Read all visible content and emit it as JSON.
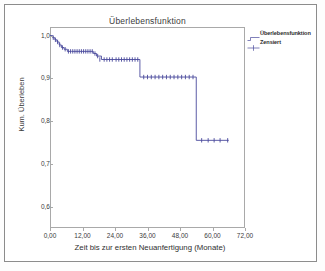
{
  "chart_data": {
    "type": "line",
    "title": "Überlebensfunktion",
    "xlabel": "Zeit bis zur ersten Neuanfertigung (Monate)",
    "ylabel": "Kum. Überleben",
    "xlim": [
      0,
      72
    ],
    "ylim": [
      0.55,
      1.02
    ],
    "grid": false,
    "legend_position": "right",
    "legend": [
      {
        "label": "Überlebensfunktion",
        "marker": "step-line",
        "color": "#4a4a9c"
      },
      {
        "label": "Zensiert",
        "marker": "plus-tick",
        "color": "#4a4a9c"
      }
    ],
    "xticks": [
      "0,00",
      "12,00",
      "24,00",
      "36,00",
      "48,00",
      "60,00",
      "72,00"
    ],
    "xtick_values": [
      0,
      12,
      24,
      36,
      48,
      60,
      72
    ],
    "yticks": [
      "1,0",
      "0,9",
      "0,8",
      "0,7",
      "0,6"
    ],
    "ytick_values": [
      1.0,
      0.9,
      0.8,
      0.7,
      0.6
    ],
    "series": [
      {
        "name": "Überlebensfunktion",
        "type": "kaplan-meier-step",
        "x": [
          0.0,
          1.0,
          1.8,
          2.6,
          3.4,
          4.2,
          5.2,
          6.4,
          8.0,
          16.0,
          17.2,
          19.0,
          24.0,
          33.2,
          54.0,
          66.0
        ],
        "y": [
          1.0,
          0.995,
          0.99,
          0.985,
          0.978,
          0.972,
          0.968,
          0.963,
          0.963,
          0.958,
          0.952,
          0.944,
          0.944,
          0.903,
          0.755,
          0.755
        ]
      }
    ],
    "censored_points": {
      "name": "Zensiert",
      "x": [
        1.2,
        2.0,
        2.8,
        3.6,
        4.6,
        5.6,
        6.8,
        7.6,
        8.4,
        9.2,
        10.0,
        10.8,
        11.6,
        12.4,
        13.2,
        14.0,
        14.8,
        15.6,
        16.6,
        17.6,
        18.4,
        20.0,
        21.0,
        22.0,
        23.0,
        24.4,
        25.4,
        26.4,
        27.4,
        28.4,
        29.4,
        30.4,
        31.4,
        32.4,
        34.6,
        36.0,
        37.4,
        38.8,
        40.2,
        41.6,
        43.0,
        44.4,
        45.8,
        47.2,
        48.6,
        50.0,
        51.4,
        52.8,
        56.0,
        58.4,
        60.6,
        62.8,
        65.6
      ],
      "y": [
        0.995,
        0.99,
        0.985,
        0.978,
        0.972,
        0.968,
        0.963,
        0.963,
        0.963,
        0.963,
        0.963,
        0.963,
        0.963,
        0.963,
        0.963,
        0.963,
        0.963,
        0.963,
        0.958,
        0.952,
        0.944,
        0.944,
        0.944,
        0.944,
        0.944,
        0.944,
        0.944,
        0.944,
        0.944,
        0.944,
        0.944,
        0.944,
        0.944,
        0.944,
        0.903,
        0.903,
        0.903,
        0.903,
        0.903,
        0.903,
        0.903,
        0.903,
        0.903,
        0.903,
        0.903,
        0.903,
        0.903,
        0.903,
        0.755,
        0.755,
        0.755,
        0.755,
        0.755
      ]
    },
    "colors": {
      "line": "#4a4a9c",
      "axis": "#a9a9a9",
      "text": "#3b3b3b",
      "background": "#ffffff"
    }
  }
}
